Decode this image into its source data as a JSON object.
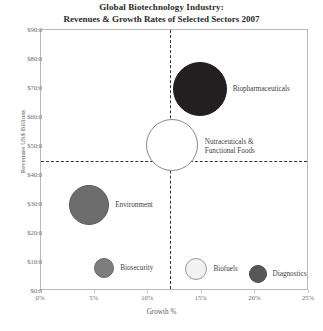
{
  "chart_data": {
    "type": "scatter",
    "title": "Global Biotechnology Industry:",
    "subtitle": "Revenues & Growth Rates of Selected Sectors 2007",
    "xlabel": "Growth %",
    "ylabel": "Revenues US$ Billions",
    "xlim": [
      0,
      25
    ],
    "ylim": [
      0,
      90
    ],
    "xticks": [
      "0%",
      "5%",
      "10%",
      "15%",
      "20%",
      "25%"
    ],
    "xtick_values": [
      0,
      5,
      10,
      15,
      20,
      25
    ],
    "yticks": [
      "$0.0",
      "$10.0",
      "$20.0",
      "$30.0",
      "$40.0",
      "$50.0",
      "$60.0",
      "$70.0",
      "$80.0",
      "$90.0"
    ],
    "ytick_values": [
      0,
      10,
      20,
      30,
      40,
      50,
      60,
      70,
      80,
      90
    ],
    "grid": false,
    "legend": "none",
    "reference_lines": [
      {
        "orientation": "vertical",
        "value": 12,
        "style": "dashed",
        "color": "#333333"
      },
      {
        "orientation": "horizontal",
        "value": 45,
        "style": "dashed",
        "color": "#333333"
      }
    ],
    "points": [
      {
        "name": "Biopharmaceuticals",
        "x": 14.8,
        "y": 69.8,
        "radius_px": 27,
        "fill": "#231f20",
        "stroke": "#231f20",
        "label_dx": 33,
        "label_dy": -4
      },
      {
        "name": "Nutraceuticals &\nFunctional Foods",
        "label_line1": "Nutraceuticals &",
        "label_line2": "Functional Foods",
        "x": 12.2,
        "y": 50.3,
        "radius_px": 26,
        "fill": "#ffffff",
        "stroke": "#8a8a8a",
        "label_dx": 33,
        "label_dy": -7
      },
      {
        "name": "Environment",
        "x": 4.5,
        "y": 29.7,
        "radius_px": 20,
        "fill": "#6d6d6d",
        "stroke": "#5a5a5a",
        "label_dx": 26,
        "label_dy": -4
      },
      {
        "name": "Biosecurity",
        "x": 5.9,
        "y": 7.9,
        "radius_px": 10,
        "fill": "#7d7d7d",
        "stroke": "#6a6a6a",
        "label_dx": 16,
        "label_dy": -4
      },
      {
        "name": "Biofuels",
        "x": 14.5,
        "y": 7.6,
        "radius_px": 11,
        "fill": "#f2f2f2",
        "stroke": "#9b9b9b",
        "label_dx": 17,
        "label_dy": -4
      },
      {
        "name": "Diagnostics",
        "x": 20.2,
        "y": 5.9,
        "radius_px": 9,
        "fill": "#575757",
        "stroke": "#4a4a4a",
        "label_dx": 15,
        "label_dy": -4
      }
    ]
  }
}
